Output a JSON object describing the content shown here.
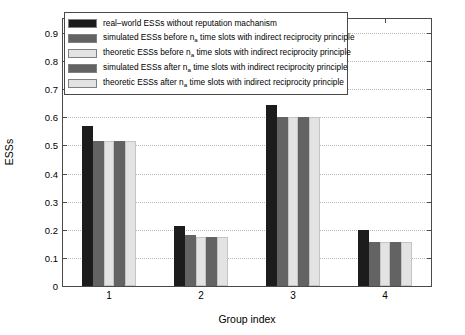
{
  "chart_data": {
    "type": "bar",
    "title": "",
    "xlabel": "Group index",
    "ylabel": "ESSs",
    "categories": [
      "1",
      "2",
      "3",
      "4"
    ],
    "ylim": [
      0,
      0.95
    ],
    "yticks": [
      0,
      0.1,
      0.2,
      0.3,
      0.4,
      0.5,
      0.6,
      0.7,
      0.8,
      0.9
    ],
    "ytick_labels": [
      "0",
      "0.1",
      "0.2",
      "0.3",
      "0.4",
      "0.5",
      "0.6",
      "0.7",
      "0.8",
      "0.9"
    ],
    "grid": "horizontal-dotted",
    "legend_position": "upper-left",
    "series": [
      {
        "name": "real-world ESSs without reputation machanism",
        "color": "#1c1c1c",
        "values": [
          0.57,
          0.215,
          0.645,
          0.2
        ]
      },
      {
        "name": "simulated ESSs before n_a time slots with indirect reciprocity principle",
        "color": "#636363",
        "values": [
          0.515,
          0.18,
          0.6,
          0.155
        ]
      },
      {
        "name": "theoretic ESSs before n_a time slots with indirect reciprocity principle",
        "color": "#e3e3e3",
        "values": [
          0.515,
          0.175,
          0.6,
          0.155
        ]
      },
      {
        "name": "simulated ESSs after n_a time slots with indirect reciprocity principle",
        "color": "#636363",
        "values": [
          0.515,
          0.175,
          0.6,
          0.155
        ]
      },
      {
        "name": "theoretic ESSs after n_a time slots with indirect reciprocity principle",
        "color": "#e3e3e3",
        "values": [
          0.515,
          0.175,
          0.6,
          0.155
        ]
      }
    ]
  },
  "legend": {
    "entries": [
      {
        "swatch_color": "#1c1c1c",
        "pre": "real–world ESSs without reputation machanism",
        "sub": "",
        "post": ""
      },
      {
        "swatch_color": "#636363",
        "pre": "simulated ESSs before n",
        "sub": "a",
        "post": " time slots with indirect reciprocity principle"
      },
      {
        "swatch_color": "#e3e3e3",
        "pre": "theoretic ESSs before n",
        "sub": "a",
        "post": " time slots with indirect reciprocity principle"
      },
      {
        "swatch_color": "#636363",
        "pre": "simulated ESSs after n",
        "sub": "a",
        "post": " time slots with indirect reciprocity principle"
      },
      {
        "swatch_color": "#e3e3e3",
        "pre": "theoretic ESSs after n",
        "sub": "a",
        "post": " time slots with indirect reciprocity principle"
      }
    ]
  },
  "axes": {
    "y_title": "ESSs",
    "x_title": "Group index"
  }
}
